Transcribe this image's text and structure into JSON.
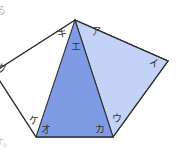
{
  "diagram": {
    "type": "pentagon-with-triangle",
    "colors": {
      "triangle_fill": "#7f9be6",
      "quad_fill": "#c3d2f6",
      "outline": "#333333",
      "background": "#ffffff"
    },
    "vertices": {
      "top": [
        75,
        20
      ],
      "right": [
        168,
        61
      ],
      "bottom_right": [
        113,
        137
      ],
      "bottom_left": [
        36,
        137
      ],
      "left": [
        -6,
        72
      ]
    },
    "angle_labels": [
      {
        "id": "a",
        "text": "ア",
        "x": 91,
        "y": 27
      },
      {
        "id": "i",
        "text": "イ",
        "x": 151,
        "y": 58
      },
      {
        "id": "u",
        "text": "ウ",
        "x": 112,
        "y": 115
      },
      {
        "id": "e",
        "text": "エ",
        "x": 71,
        "y": 42
      },
      {
        "id": "o",
        "text": "オ",
        "x": 40,
        "y": 126
      },
      {
        "id": "ka",
        "text": "カ",
        "x": 95,
        "y": 126
      },
      {
        "id": "ki",
        "text": "キ",
        "x": 57,
        "y": 29
      },
      {
        "id": "ku",
        "text": "ク",
        "x": -3,
        "y": 64
      },
      {
        "id": "ke",
        "text": "ケ",
        "x": 30,
        "y": 117
      }
    ],
    "partial_text": {
      "top_left": "る",
      "bottom_left": "す。"
    }
  }
}
